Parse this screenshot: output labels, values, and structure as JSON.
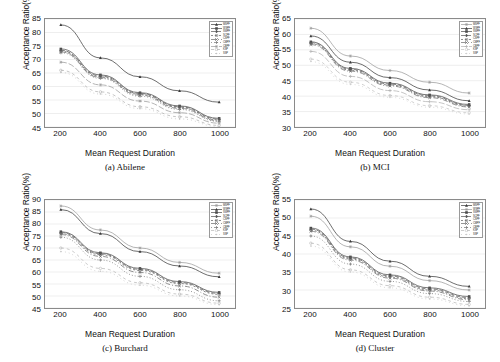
{
  "figure": {
    "panel_count": 4,
    "shared_xlabel": "Mean Request Duration",
    "shared_ylabel": "Acceptance Ratio(%)"
  },
  "series_names": [
    "MSPF",
    "WSPF",
    "SWPF",
    "SCPF",
    "CSPF",
    "CMPF",
    "CBPF",
    "KSP",
    "SSP"
  ],
  "chart_data": [
    {
      "type": "line",
      "title": "(a) Abilene",
      "xlabel": "Mean Request Duration",
      "ylabel": "Acceptance Ratio(%)",
      "x": [
        200,
        400,
        600,
        800,
        1000
      ],
      "xticks": [
        200,
        400,
        600,
        800,
        1000
      ],
      "yticks": [
        45,
        50,
        55,
        60,
        65,
        70,
        75,
        80,
        85
      ],
      "xlim": [
        120,
        1080
      ],
      "ylim": [
        45,
        85
      ],
      "grid": true,
      "legend_position": "top-right",
      "series": [
        {
          "name": "MSPF",
          "values": [
            82.8,
            70.6,
            63.6,
            58.4,
            54.2
          ],
          "color": "#3a3a3a",
          "dash": "none",
          "marker": "triangle"
        },
        {
          "name": "WSPF",
          "values": [
            73.9,
            64.3,
            57.7,
            52.8,
            48.2
          ],
          "color": "#4a4a4a",
          "dash": "none",
          "marker": "square"
        },
        {
          "name": "SWPF",
          "values": [
            73.4,
            63.9,
            57.4,
            52.5,
            47.9
          ],
          "color": "#555555",
          "dash": "4,2",
          "marker": "diamond"
        },
        {
          "name": "SCPF",
          "values": [
            73.1,
            63.6,
            57.1,
            52.2,
            47.6
          ],
          "color": "#5e5e5e",
          "dash": "2,2",
          "marker": "circle"
        },
        {
          "name": "CSPF",
          "values": [
            72.8,
            63.3,
            56.8,
            51.9,
            47.3
          ],
          "color": "#6a6a6a",
          "dash": "5,2,1,2",
          "marker": "cross"
        },
        {
          "name": "CMPF",
          "values": [
            72.5,
            63.0,
            56.4,
            51.5,
            47.0
          ],
          "color": "#777777",
          "dash": "1,2",
          "marker": "plus"
        },
        {
          "name": "CBPF",
          "values": [
            69.0,
            60.6,
            54.6,
            50.3,
            46.4
          ],
          "color": "#9a9a9a",
          "dash": "6,2",
          "marker": "star"
        },
        {
          "name": "KSP",
          "values": [
            66.0,
            58.0,
            52.5,
            48.8,
            45.6
          ],
          "color": "#b0b0b0",
          "dash": "3,3",
          "marker": "circle"
        },
        {
          "name": "SSP",
          "values": [
            65.2,
            57.2,
            51.8,
            48.0,
            45.2
          ],
          "color": "#c2c2c2",
          "dash": "1,3",
          "marker": "dot"
        }
      ]
    },
    {
      "type": "line",
      "title": "(b) MCI",
      "xlabel": "Mean Request Duration",
      "ylabel": "Acceptance Ratio(%)",
      "x": [
        200,
        400,
        600,
        800,
        1000
      ],
      "xticks": [
        200,
        400,
        600,
        800,
        1000
      ],
      "yticks": [
        30,
        35,
        40,
        45,
        50,
        55,
        60,
        65
      ],
      "xlim": [
        120,
        1080
      ],
      "ylim": [
        30,
        65
      ],
      "grid": true,
      "legend_position": "top-right",
      "series": [
        {
          "name": "MSPF",
          "values": [
            62.0,
            53.0,
            48.3,
            44.5,
            41.0
          ],
          "color": "#9a9a9a",
          "dash": "none",
          "marker": "star"
        },
        {
          "name": "WSPF",
          "values": [
            59.5,
            51.0,
            46.0,
            42.0,
            38.5
          ],
          "color": "#3a3a3a",
          "dash": "none",
          "marker": "triangle"
        },
        {
          "name": "SWPF",
          "values": [
            57.6,
            49.0,
            44.2,
            40.4,
            37.3
          ],
          "color": "#4a4a4a",
          "dash": "none",
          "marker": "square"
        },
        {
          "name": "SCPF",
          "values": [
            57.3,
            48.7,
            43.9,
            40.1,
            37.0
          ],
          "color": "#555555",
          "dash": "4,2",
          "marker": "diamond"
        },
        {
          "name": "CSPF",
          "values": [
            57.0,
            48.4,
            43.6,
            39.8,
            36.8
          ],
          "color": "#5e5e5e",
          "dash": "2,2",
          "marker": "circle"
        },
        {
          "name": "CMPF",
          "values": [
            56.7,
            48.1,
            43.3,
            39.5,
            36.5
          ],
          "color": "#6a6a6a",
          "dash": "5,2,1,2",
          "marker": "cross"
        },
        {
          "name": "CBPF",
          "values": [
            54.5,
            46.4,
            41.8,
            38.2,
            35.6
          ],
          "color": "#b0b0b0",
          "dash": "6,2",
          "marker": "plus"
        },
        {
          "name": "KSP",
          "values": [
            52.0,
            44.5,
            40.2,
            36.9,
            34.6
          ],
          "color": "#c2c2c2",
          "dash": "3,3",
          "marker": "circle"
        },
        {
          "name": "SSP",
          "values": [
            51.2,
            43.8,
            39.6,
            36.4,
            34.2
          ],
          "color": "#cfcfcf",
          "dash": "1,3",
          "marker": "dot"
        }
      ]
    },
    {
      "type": "line",
      "title": "(c) Burchard",
      "xlabel": "Mean Request Duration",
      "ylabel": "Acceptance Ratio(%)",
      "x": [
        200,
        400,
        600,
        800,
        1000
      ],
      "xticks": [
        200,
        400,
        600,
        800,
        1000
      ],
      "yticks": [
        45,
        50,
        55,
        60,
        65,
        70,
        75,
        80,
        85,
        90
      ],
      "xlim": [
        120,
        1080
      ],
      "ylim": [
        45,
        90
      ],
      "grid": true,
      "legend_position": "top-right",
      "series": [
        {
          "name": "MSPF",
          "values": [
            87.5,
            77.5,
            70.0,
            64.0,
            59.5
          ],
          "color": "#9a9a9a",
          "dash": "none",
          "marker": "star"
        },
        {
          "name": "WSPF",
          "values": [
            86.0,
            76.0,
            68.5,
            62.5,
            58.0
          ],
          "color": "#3a3a3a",
          "dash": "none",
          "marker": "triangle"
        },
        {
          "name": "SWPF",
          "values": [
            76.8,
            68.0,
            61.5,
            56.0,
            51.5
          ],
          "color": "#4a4a4a",
          "dash": "none",
          "marker": "square"
        },
        {
          "name": "SCPF",
          "values": [
            76.4,
            67.6,
            61.1,
            55.6,
            51.1
          ],
          "color": "#555555",
          "dash": "4,2",
          "marker": "diamond"
        },
        {
          "name": "CSPF",
          "values": [
            76.0,
            67.2,
            60.7,
            55.2,
            50.7
          ],
          "color": "#5e5e5e",
          "dash": "2,2",
          "marker": "circle"
        },
        {
          "name": "CMPF",
          "values": [
            75.6,
            66.5,
            59.8,
            54.2,
            49.5
          ],
          "color": "#6a6a6a",
          "dash": "5,2,1,2",
          "marker": "cross"
        },
        {
          "name": "CBPF",
          "values": [
            74.5,
            65.0,
            58.2,
            52.6,
            48.0
          ],
          "color": "#777777",
          "dash": "1,2",
          "marker": "plus"
        },
        {
          "name": "KSP",
          "values": [
            70.0,
            61.5,
            55.5,
            50.8,
            47.0
          ],
          "color": "#b8b8b8",
          "dash": "3,3",
          "marker": "circle"
        },
        {
          "name": "SSP",
          "values": [
            68.5,
            60.3,
            54.5,
            50.0,
            46.4
          ],
          "color": "#c8c8c8",
          "dash": "1,3",
          "marker": "dot"
        }
      ]
    },
    {
      "type": "line",
      "title": "(d) Cluster",
      "xlabel": "Mean Request Duration",
      "ylabel": "Acceptance Ratio(%)",
      "x": [
        200,
        400,
        600,
        800,
        1000
      ],
      "xticks": [
        200,
        400,
        600,
        800,
        1000
      ],
      "yticks": [
        25,
        30,
        35,
        40,
        45,
        50,
        55
      ],
      "xlim": [
        120,
        1080
      ],
      "ylim": [
        25,
        55
      ],
      "grid": true,
      "legend_position": "top-right",
      "series": [
        {
          "name": "MSPF",
          "values": [
            52.5,
            43.5,
            38.0,
            33.8,
            31.0
          ],
          "color": "#3a3a3a",
          "dash": "none",
          "marker": "triangle"
        },
        {
          "name": "WSPF",
          "values": [
            50.5,
            42.0,
            36.6,
            32.6,
            30.0
          ],
          "color": "#9a9a9a",
          "dash": "none",
          "marker": "star"
        },
        {
          "name": "SWPF",
          "values": [
            47.2,
            39.2,
            34.2,
            30.6,
            28.2
          ],
          "color": "#4a4a4a",
          "dash": "none",
          "marker": "square"
        },
        {
          "name": "SCPF",
          "values": [
            46.9,
            38.9,
            33.9,
            30.3,
            27.9
          ],
          "color": "#555555",
          "dash": "4,2",
          "marker": "diamond"
        },
        {
          "name": "CSPF",
          "values": [
            46.6,
            38.6,
            33.6,
            30.0,
            27.6
          ],
          "color": "#5e5e5e",
          "dash": "2,2",
          "marker": "circle"
        },
        {
          "name": "CMPF",
          "values": [
            46.3,
            38.3,
            33.3,
            29.7,
            27.3
          ],
          "color": "#6a6a6a",
          "dash": "5,2,1,2",
          "marker": "cross"
        },
        {
          "name": "CBPF",
          "values": [
            45.0,
            37.2,
            32.4,
            29.0,
            26.8
          ],
          "color": "#777777",
          "dash": "1,2",
          "marker": "plus"
        },
        {
          "name": "KSP",
          "values": [
            43.0,
            35.6,
            31.2,
            28.0,
            26.0
          ],
          "color": "#b8b8b8",
          "dash": "3,3",
          "marker": "circle"
        },
        {
          "name": "SSP",
          "values": [
            42.2,
            35.0,
            30.6,
            27.5,
            25.6
          ],
          "color": "#cacaca",
          "dash": "1,3",
          "marker": "dot"
        }
      ]
    }
  ]
}
